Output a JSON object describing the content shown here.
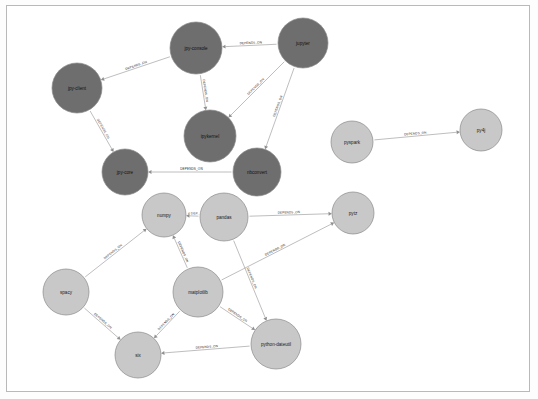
{
  "diagram": {
    "edge_label_default": "DEPENDS_ON",
    "edge_label_truncated": "< DEP...",
    "colors": {
      "node_dark": "#6e6e6e",
      "node_light": "#c8c8c8",
      "node_stroke": "#8a8a8a",
      "edge": "#9a9a9a",
      "background": "#ffffff",
      "border": "#b9b9b9",
      "label_text": "#1a1a1a"
    },
    "nodes": [
      {
        "id": "jpy-console",
        "label": "jpy-console",
        "x": 196,
        "y": 48,
        "r": 26,
        "tone": "dark"
      },
      {
        "id": "jupyter",
        "label": "jupyter",
        "x": 303,
        "y": 43,
        "r": 25,
        "tone": "dark"
      },
      {
        "id": "jpy-client",
        "label": "jpy-client",
        "x": 77,
        "y": 88,
        "r": 25,
        "tone": "dark"
      },
      {
        "id": "ipykernel",
        "label": "ipykernel",
        "x": 210,
        "y": 136,
        "r": 26,
        "tone": "dark"
      },
      {
        "id": "pyspark",
        "label": "pyspark",
        "x": 352,
        "y": 142,
        "r": 21,
        "tone": "light"
      },
      {
        "id": "py4j",
        "label": "py4j",
        "x": 481,
        "y": 130,
        "r": 21,
        "tone": "light"
      },
      {
        "id": "jpy-core",
        "label": "jpy-core",
        "x": 125,
        "y": 172,
        "r": 23,
        "tone": "dark"
      },
      {
        "id": "nbconvert",
        "label": "nbconvert",
        "x": 257,
        "y": 172,
        "r": 24,
        "tone": "dark"
      },
      {
        "id": "numpy",
        "label": "numpy",
        "x": 164,
        "y": 215,
        "r": 22,
        "tone": "light"
      },
      {
        "id": "pandas",
        "label": "pandas",
        "x": 224,
        "y": 217,
        "r": 24,
        "tone": "light"
      },
      {
        "id": "pytz",
        "label": "pytz",
        "x": 353,
        "y": 213,
        "r": 21,
        "tone": "light"
      },
      {
        "id": "spacy",
        "label": "spacy",
        "x": 66,
        "y": 292,
        "r": 23,
        "tone": "light"
      },
      {
        "id": "matplotlib",
        "label": "matplotlib",
        "x": 198,
        "y": 292,
        "r": 25,
        "tone": "light"
      },
      {
        "id": "python-dateutil",
        "label": "python-dateutil",
        "x": 276,
        "y": 344,
        "r": 25,
        "tone": "light"
      },
      {
        "id": "six",
        "label": "six",
        "x": 138,
        "y": 355,
        "r": 23,
        "tone": "light"
      }
    ],
    "edges": [
      {
        "from": "jupyter",
        "to": "jpy-console",
        "label": "DEPENDS_ON"
      },
      {
        "from": "jupyter",
        "to": "ipykernel",
        "label": "DEPENDS_ON"
      },
      {
        "from": "jupyter",
        "to": "nbconvert",
        "label": "DEPENDS_ON"
      },
      {
        "from": "jpy-console",
        "to": "jpy-client",
        "label": "DEPENDS_ON"
      },
      {
        "from": "jpy-console",
        "to": "ipykernel",
        "label": "DEPENDS_ON"
      },
      {
        "from": "jpy-client",
        "to": "jpy-core",
        "label": "DEPENDS_ON"
      },
      {
        "from": "nbconvert",
        "to": "jpy-core",
        "label": "DEPENDS_ON"
      },
      {
        "from": "pyspark",
        "to": "py4j",
        "label": "DEPENDS_ON"
      },
      {
        "from": "pandas",
        "to": "numpy",
        "label": "< DEP..."
      },
      {
        "from": "pandas",
        "to": "pytz",
        "label": "DEPENDS_ON"
      },
      {
        "from": "pandas",
        "to": "python-dateutil",
        "label": "DEPENDS_ON"
      },
      {
        "from": "spacy",
        "to": "numpy",
        "label": "DEPENDS_ON"
      },
      {
        "from": "spacy",
        "to": "six",
        "label": "DEPENDS_ON"
      },
      {
        "from": "matplotlib",
        "to": "numpy",
        "label": "DEPENDS_ON"
      },
      {
        "from": "matplotlib",
        "to": "six",
        "label": "DEPENDS_ON"
      },
      {
        "from": "matplotlib",
        "to": "python-dateutil",
        "label": "DEPENDS_ON"
      },
      {
        "from": "matplotlib",
        "to": "pytz",
        "label": "DEPENDS_ON"
      },
      {
        "from": "python-dateutil",
        "to": "six",
        "label": "DEPENDS_ON"
      }
    ]
  }
}
